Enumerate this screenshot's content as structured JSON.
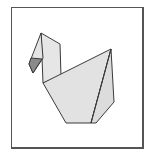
{
  "diagram": {
    "colors": {
      "paper_fill": "#e2e2e2",
      "neck_fill": "#e6e6e6",
      "beak_fill": "#8a8a8a",
      "outline": "#3a3a3a",
      "frame": "#555555"
    },
    "parts": [
      "frame",
      "neck",
      "head",
      "beak",
      "body",
      "body-fold",
      "tail-flap"
    ]
  }
}
